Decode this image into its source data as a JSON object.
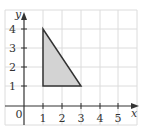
{
  "diagram": {
    "type": "coordinate-plane",
    "x_axis_label": "x",
    "y_axis_label": "y",
    "origin_label": "0",
    "x_ticks": [
      "1",
      "2",
      "3",
      "4",
      "5"
    ],
    "y_ticks": [
      "1",
      "2",
      "3",
      "4"
    ],
    "xlim": [
      0,
      5.5
    ],
    "ylim": [
      0,
      5
    ],
    "grid": true,
    "shape": {
      "kind": "triangle",
      "vertices": [
        [
          1,
          4
        ],
        [
          1,
          1
        ],
        [
          3,
          1
        ]
      ],
      "fill": "#d3d3d3",
      "stroke": "#333333"
    }
  }
}
